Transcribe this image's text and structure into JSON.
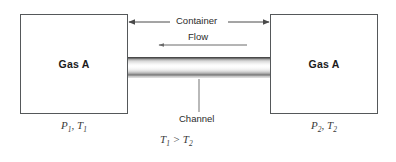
{
  "diagram": {
    "vessels": [
      {
        "name": "left-container",
        "label": "Gas A",
        "state": "P₁, T₁"
      },
      {
        "name": "right-container",
        "label": "Gas A",
        "state": "P₂, T₂"
      }
    ],
    "annotations": {
      "container": "Container",
      "flow": "Flow",
      "channel": "Channel",
      "inequality": "T₁ > T₂"
    },
    "state_parts": {
      "left": {
        "p_symbol": "P",
        "p_sub": "1",
        "t_symbol": "T",
        "t_sub": "1"
      },
      "right": {
        "p_symbol": "P",
        "p_sub": "2",
        "t_symbol": "T",
        "t_sub": "2"
      }
    },
    "inequality_parts": {
      "lhs_symbol": "T",
      "lhs_sub": "1",
      "operator": ">",
      "rhs_symbol": "T",
      "rhs_sub": "2"
    },
    "arrows": {
      "container_arrow": {
        "name": "double-headed-arrow",
        "direction": "both",
        "from_x": 128,
        "to_x": 270,
        "y": 22
      },
      "flow_arrow": {
        "name": "flow-arrow",
        "direction": "left",
        "from_x": 247,
        "to_x": 158,
        "y": 45
      },
      "channel_leader": {
        "name": "leader-line",
        "x": 199,
        "from_y": 79,
        "to_y": 112
      }
    },
    "colors": {
      "stroke": "#55585a",
      "arrow": "#4a4a4a",
      "text": "#2b2b2b",
      "state_text": "#3a3a3a",
      "background": "#ffffff",
      "channel_highlight": "#ffffff",
      "channel_shadow": "#4a4a4a"
    }
  }
}
